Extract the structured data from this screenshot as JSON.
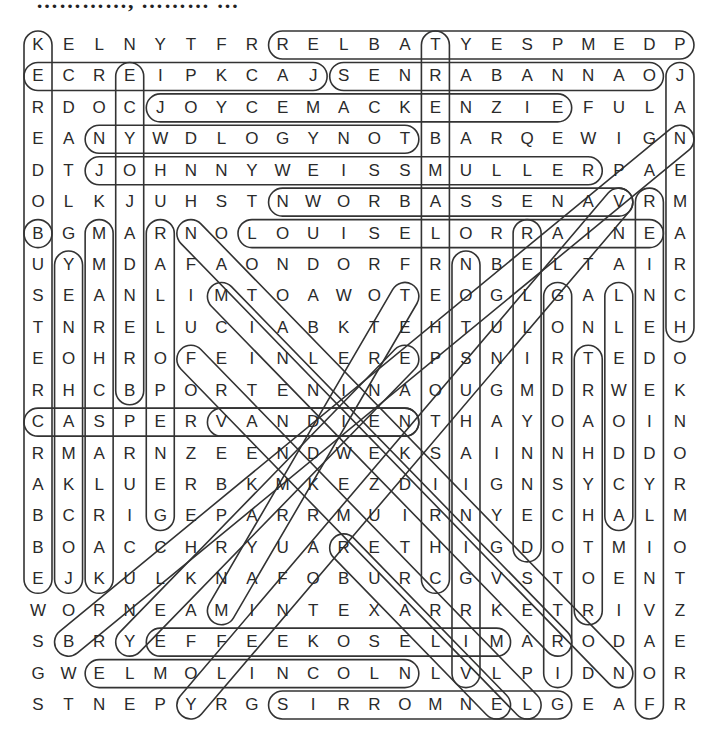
{
  "title": "…………, ……… …",
  "grid": {
    "origin_x": 38,
    "origin_y": 45,
    "step_x": 30.57,
    "step_y": 31.43,
    "rows": [
      "KELNYTFRRELBATYESPMEDP",
      "ECREIPKCAJSENRABANNAOJ",
      "RDOCJOYCEMACKENZIEFULA",
      "EANYWDLOGYNOTBARQEWIGN",
      "DTJOHNNYWEISSMULLERPAE",
      "OLKJUHSTNWORBASSENAVRM",
      "BGMARNOLOUISELORRAINEA",
      "UYMDAFAONDORFRNBELTAIR",
      "SEANLIMTOAWOTEOGLGALNC",
      "TNRELUCIABKTEHTULONLEH",
      "EOHROFEINLEREPSNIRTEDO",
      "RHCBPORTENINAOUGMDRWEK",
      "CASPERVANDIENTHAYOAOIN",
      "RMARNZEENDWEKSAINNHDDO",
      "AKLUERBKMKEZDIIGNSYCYR",
      "BCRIGEPARRMUIRNYECHALM",
      "BOACCHRYUARETHIGDOTMIO",
      "EJKULKNAFOBURCGVSTOENT",
      "WORNEAMINTEXARRKETRIVZ",
      "SBRYEFFEEKOSELIMARODAE",
      "GWELMOLINCOLNLVLPIDNOR",
      "STNEPYRGSIRROMNELGEAFR"
    ]
  },
  "found_words": [
    {
      "r1": 0,
      "c1": 8,
      "r2": 0,
      "c2": 21
    },
    {
      "r1": 1,
      "c1": 0,
      "r2": 1,
      "c2": 9
    },
    {
      "r1": 1,
      "c1": 10,
      "r2": 1,
      "c2": 20
    },
    {
      "r1": 2,
      "c1": 4,
      "r2": 2,
      "c2": 17
    },
    {
      "r1": 3,
      "c1": 2,
      "r2": 3,
      "c2": 12
    },
    {
      "r1": 4,
      "c1": 2,
      "r2": 4,
      "c2": 18
    },
    {
      "r1": 5,
      "c1": 8,
      "r2": 5,
      "c2": 19
    },
    {
      "r1": 6,
      "c1": 7,
      "r2": 6,
      "c2": 20
    },
    {
      "r1": 12,
      "c1": 0,
      "r2": 12,
      "c2": 12
    },
    {
      "r1": 12,
      "c1": 6,
      "r2": 12,
      "c2": 12
    },
    {
      "r1": 19,
      "c1": 4,
      "r2": 19,
      "c2": 15
    },
    {
      "r1": 20,
      "c1": 2,
      "r2": 20,
      "c2": 12
    },
    {
      "r1": 21,
      "c1": 8,
      "r2": 21,
      "c2": 17
    },
    {
      "r1": 0,
      "c1": 0,
      "r2": 6,
      "c2": 0
    },
    {
      "r1": 6,
      "c1": 0,
      "r2": 17,
      "c2": 0
    },
    {
      "r1": 7,
      "c1": 1,
      "r2": 17,
      "c2": 1
    },
    {
      "r1": 6,
      "c1": 2,
      "r2": 17,
      "c2": 2
    },
    {
      "r1": 1,
      "c1": 3,
      "r2": 11,
      "c2": 3
    },
    {
      "r1": 6,
      "c1": 4,
      "r2": 15,
      "c2": 4
    },
    {
      "r1": 0,
      "c1": 13,
      "r2": 17,
      "c2": 13
    },
    {
      "r1": 7,
      "c1": 14,
      "r2": 20,
      "c2": 14
    },
    {
      "r1": 6,
      "c1": 16,
      "r2": 16,
      "c2": 16
    },
    {
      "r1": 8,
      "c1": 17,
      "r2": 20,
      "c2": 17
    },
    {
      "r1": 10,
      "c1": 18,
      "r2": 18,
      "c2": 18
    },
    {
      "r1": 8,
      "c1": 19,
      "r2": 15,
      "c2": 19
    },
    {
      "r1": 5,
      "c1": 20,
      "r2": 21,
      "c2": 20
    },
    {
      "r1": 1,
      "c1": 21,
      "r2": 9,
      "c2": 21
    },
    {
      "r1": 6,
      "c1": 5,
      "r2": 20,
      "c2": 19
    },
    {
      "r1": 8,
      "c1": 6,
      "r2": 19,
      "c2": 17
    },
    {
      "r1": 10,
      "c1": 5,
      "r2": 21,
      "c2": 16
    },
    {
      "r1": 8,
      "c1": 12,
      "r2": 18,
      "c2": 6
    },
    {
      "r1": 10,
      "c1": 12,
      "r2": 19,
      "c2": 3
    },
    {
      "r1": 3,
      "c1": 21,
      "r2": 19,
      "c2": 1
    },
    {
      "r1": 5,
      "c1": 19,
      "r2": 21,
      "c2": 5
    },
    {
      "r1": 16,
      "c1": 10,
      "r2": 21,
      "c2": 15
    }
  ]
}
